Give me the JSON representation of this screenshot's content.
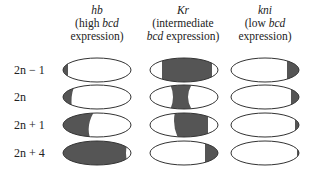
{
  "columns": [
    {
      "gene": "hb",
      "line1_pre": "(high ",
      "line1_italic": "bcd",
      "line1_post": "",
      "line2": "expression)"
    },
    {
      "gene": "Kr",
      "line1_pre": "(intermediate",
      "line1_italic": "",
      "line1_post": "",
      "line2_italic": "bcd",
      "line2": " expression)"
    },
    {
      "gene": "kni",
      "line1_pre": "(low ",
      "line1_italic": "bcd",
      "line1_post": "",
      "line2": "expression)"
    }
  ],
  "rows": [
    {
      "label": "2n − 1"
    },
    {
      "label": "2n"
    },
    {
      "label": "2n + 1"
    },
    {
      "label": "2n + 4"
    }
  ],
  "colors": {
    "fill": "#555555",
    "outline": "#333333",
    "background": "#ffffff"
  }
}
